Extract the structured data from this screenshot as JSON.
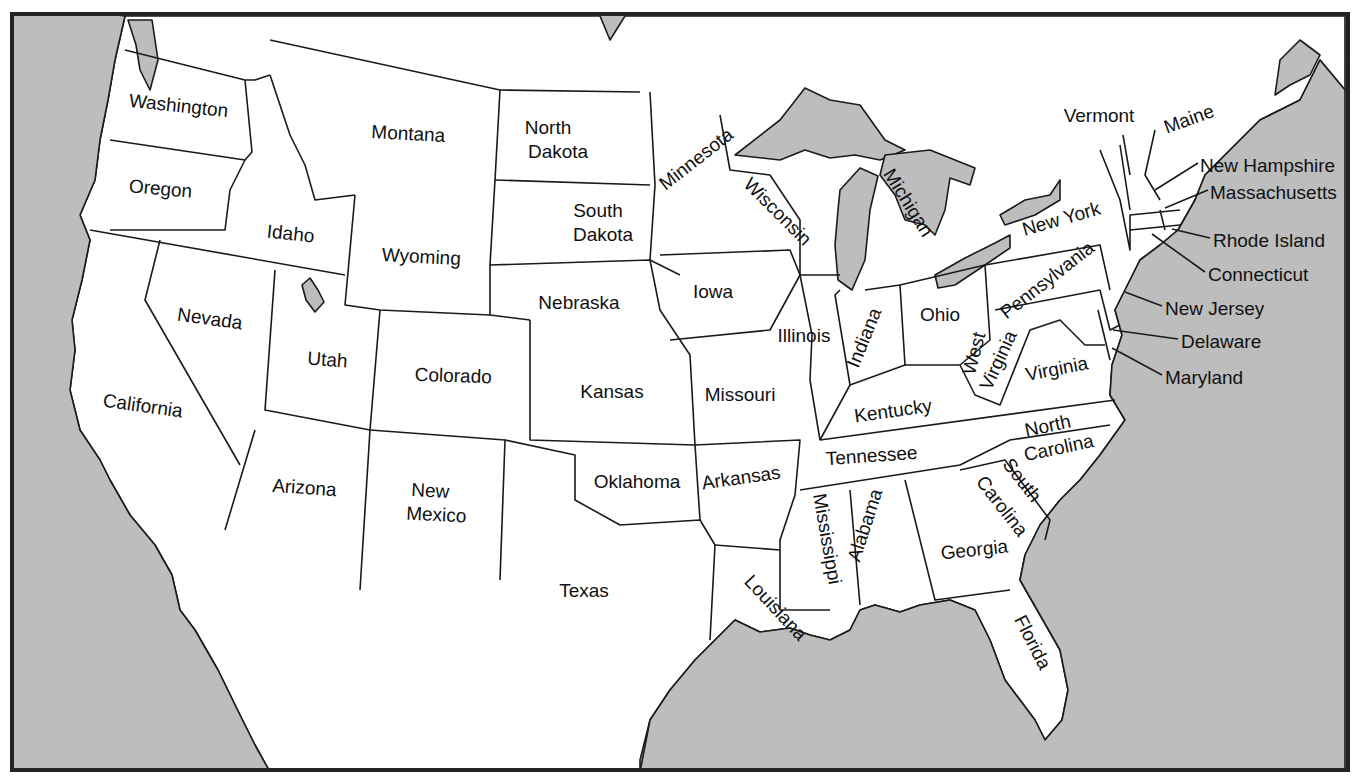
{
  "map": {
    "title_fragment": "",
    "colors": {
      "land": "#ffffff",
      "water": "#bdbdbd",
      "border": "#1a1a1a",
      "frame": "#222222"
    },
    "states": [
      {
        "name": "Washington",
        "x": 178,
        "y": 112,
        "rot": 6
      },
      {
        "name": "Oregon",
        "x": 160,
        "y": 195,
        "rot": 5
      },
      {
        "name": "California",
        "x": 142,
        "y": 412,
        "rot": 8
      },
      {
        "name": "Idaho",
        "x": 290,
        "y": 240,
        "rot": 6
      },
      {
        "name": "Nevada",
        "x": 209,
        "y": 325,
        "rot": 8
      },
      {
        "name": "Montana",
        "x": 408,
        "y": 140,
        "rot": 3
      },
      {
        "name": "Wyoming",
        "x": 421,
        "y": 263,
        "rot": 3
      },
      {
        "name": "Utah",
        "x": 327,
        "y": 366,
        "rot": 4
      },
      {
        "name": "Arizona",
        "x": 304,
        "y": 494,
        "rot": 4
      },
      {
        "name": "Colorado",
        "x": 453,
        "y": 382,
        "rot": 2
      },
      {
        "name": "New",
        "x": 430,
        "y": 497,
        "rot": 3
      },
      {
        "name": "Mexico",
        "x": 436,
        "y": 521,
        "rot": 3
      },
      {
        "name": "North",
        "x": 548,
        "y": 134,
        "rot": 0
      },
      {
        "name": "Dakota",
        "x": 558,
        "y": 158,
        "rot": 0
      },
      {
        "name": "South",
        "x": 598,
        "y": 217,
        "rot": 0
      },
      {
        "name": "Dakota",
        "x": 603,
        "y": 241,
        "rot": 0
      },
      {
        "name": "Nebraska",
        "x": 579,
        "y": 309,
        "rot": 0
      },
      {
        "name": "Kansas",
        "x": 612,
        "y": 398,
        "rot": 0
      },
      {
        "name": "Oklahoma",
        "x": 637,
        "y": 488,
        "rot": 0
      },
      {
        "name": "Texas",
        "x": 584,
        "y": 597,
        "rot": 0
      },
      {
        "name": "Minnesota",
        "x": 700,
        "y": 164,
        "rot": -38
      },
      {
        "name": "Iowa",
        "x": 713,
        "y": 298,
        "rot": 0
      },
      {
        "name": "Missouri",
        "x": 740,
        "y": 401,
        "rot": 0
      },
      {
        "name": "Arkansas",
        "x": 742,
        "y": 484,
        "rot": -8
      },
      {
        "name": "Louisiana",
        "x": 771,
        "y": 612,
        "rot": 47
      },
      {
        "name": "Wisconsin",
        "x": 773,
        "y": 216,
        "rot": 45
      },
      {
        "name": "Illinois",
        "x": 804,
        "y": 342,
        "rot": 0
      },
      {
        "name": "Michigan",
        "x": 903,
        "y": 206,
        "rot": 58
      },
      {
        "name": "Indiana",
        "x": 870,
        "y": 340,
        "rot": -68
      },
      {
        "name": "Ohio",
        "x": 940,
        "y": 321,
        "rot": 0
      },
      {
        "name": "Kentucky",
        "x": 894,
        "y": 417,
        "rot": -8
      },
      {
        "name": "Tennessee",
        "x": 872,
        "y": 462,
        "rot": -4
      },
      {
        "name": "Mississippi",
        "x": 821,
        "y": 540,
        "rot": 80
      },
      {
        "name": "Alabama",
        "x": 871,
        "y": 527,
        "rot": -72
      },
      {
        "name": "Georgia",
        "x": 975,
        "y": 556,
        "rot": -6
      },
      {
        "name": "Florida",
        "x": 1027,
        "y": 645,
        "rot": 63
      },
      {
        "name": "South",
        "x": 1017,
        "y": 484,
        "rot": 52
      },
      {
        "name": "Carolina",
        "x": 997,
        "y": 510,
        "rot": 52
      },
      {
        "name": "North",
        "x": 1049,
        "y": 432,
        "rot": -12
      },
      {
        "name": "Carolina",
        "x": 1060,
        "y": 454,
        "rot": -12
      },
      {
        "name": "Virginia",
        "x": 1058,
        "y": 375,
        "rot": -11
      },
      {
        "name": "West",
        "x": 980,
        "y": 355,
        "rot": -75
      },
      {
        "name": "Virginia",
        "x": 1004,
        "y": 363,
        "rot": -65
      },
      {
        "name": "Pennsylvania",
        "x": 1051,
        "y": 285,
        "rot": -38
      },
      {
        "name": "New York",
        "x": 1063,
        "y": 225,
        "rot": -16
      },
      {
        "name": "Vermont",
        "x": 1099,
        "y": 122,
        "rot": 0
      },
      {
        "name": "Maine",
        "x": 1191,
        "y": 125,
        "rot": -20
      }
    ],
    "callouts": [
      {
        "name": "New Hampshire",
        "x": 1200,
        "y": 166,
        "lx1": 1155,
        "ly1": 190,
        "lx2": 1198,
        "ly2": 163
      },
      {
        "name": "Massachusetts",
        "x": 1210,
        "y": 193,
        "lx1": 1165,
        "ly1": 208,
        "lx2": 1208,
        "ly2": 190
      },
      {
        "name": "Rhode Island",
        "x": 1213,
        "y": 241,
        "lx1": 1172,
        "ly1": 229,
        "lx2": 1210,
        "ly2": 238
      },
      {
        "name": "Connecticut",
        "x": 1208,
        "y": 275,
        "lx1": 1152,
        "ly1": 234,
        "lx2": 1205,
        "ly2": 272
      },
      {
        "name": "New Jersey",
        "x": 1165,
        "y": 309,
        "lx1": 1125,
        "ly1": 292,
        "lx2": 1162,
        "ly2": 306
      },
      {
        "name": "Delaware",
        "x": 1181,
        "y": 342,
        "lx1": 1113,
        "ly1": 330,
        "lx2": 1178,
        "ly2": 339
      },
      {
        "name": "Maryland",
        "x": 1165,
        "y": 378,
        "lx1": 1112,
        "ly1": 348,
        "lx2": 1162,
        "ly2": 375
      }
    ]
  }
}
